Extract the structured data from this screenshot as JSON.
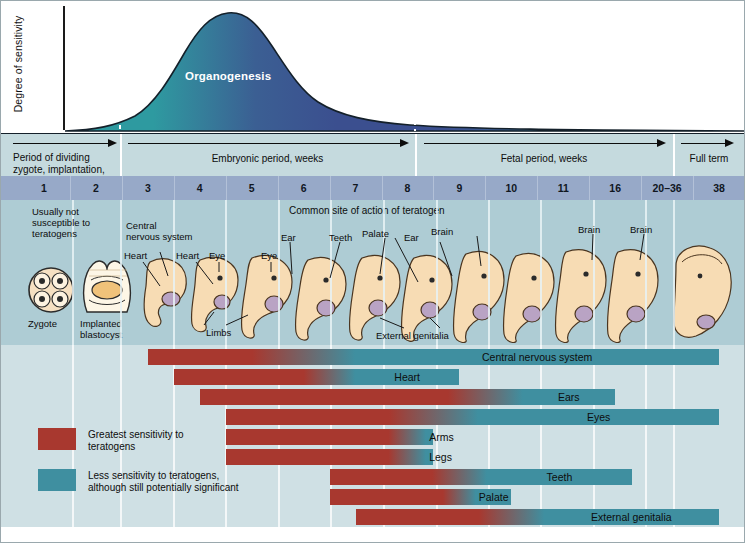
{
  "figure": {
    "y_axis_label": "Degree of sensitivity",
    "curve_label": "Organogenesis",
    "common_site_label": "Common site of action of teratogen"
  },
  "periods": [
    {
      "id": "dividing-zygote",
      "label": "Period of dividing\nzygote, implantation,\nand embryo, weeks",
      "align": "left"
    },
    {
      "id": "embryonic",
      "label": "Embryonic period, weeks",
      "align": "center"
    },
    {
      "id": "fetal",
      "label": "Fetal period, weeks",
      "align": "center"
    },
    {
      "id": "full-term",
      "label": "Full term",
      "align": "center"
    }
  ],
  "weeks": [
    "1",
    "2",
    "3",
    "4",
    "5",
    "6",
    "7",
    "8",
    "9",
    "10",
    "11",
    "16",
    "20–36",
    "38"
  ],
  "embryo_stages": [
    {
      "id": "zygote",
      "caption": "Zygote"
    },
    {
      "id": "implanted-blastocyst",
      "caption": "Implanted\nblastocyst"
    }
  ],
  "embryo_notes": [
    {
      "id": "usually-not-susceptible",
      "text": "Usually not\nsusceptible to\nteratogens"
    },
    {
      "id": "central-nervous-system",
      "text": "Central\nnervous system"
    },
    {
      "id": "heart-w3",
      "text": "Heart"
    },
    {
      "id": "heart-w4",
      "text": "Heart"
    },
    {
      "id": "eye-w4",
      "text": "Eye"
    },
    {
      "id": "eye-w5",
      "text": "Eye"
    },
    {
      "id": "limbs",
      "text": "Limbs"
    },
    {
      "id": "ear-w6",
      "text": "Ear"
    },
    {
      "id": "teeth",
      "text": "Teeth"
    },
    {
      "id": "palate",
      "text": "Palate"
    },
    {
      "id": "ear-w8",
      "text": "Ear"
    },
    {
      "id": "brain-w9",
      "text": "Brain"
    },
    {
      "id": "external-genitalia",
      "text": "External genitalia"
    },
    {
      "id": "brain-w16",
      "text": "Brain"
    },
    {
      "id": "brain-w2036",
      "text": "Brain"
    }
  ],
  "legend": {
    "greatest": "Greatest sensitivity to\nteratogens",
    "less": "Less sensitivity to teratogens,\nalthough still potentially significant",
    "greatest_color": "#a8382f",
    "less_color": "#3f8fa0"
  },
  "colors": {
    "curve_peak": "#3b4f8f",
    "curve_early": "#2e9aa0",
    "period_band": "#c5dade",
    "week_band": "#97a9c8",
    "embryo_band": "#aeccd4",
    "bars_band": "#cfe0e4"
  },
  "chart_data": {
    "type": "bar",
    "xlabel": "Weeks of gestation",
    "ylabel": "Degree of sensitivity",
    "categories": [
      "1",
      "2",
      "3",
      "4",
      "5",
      "6",
      "7",
      "8",
      "9",
      "10",
      "11",
      "16",
      "20–36",
      "38"
    ],
    "sensitivity_curve": {
      "label": "Organogenesis",
      "note": "Degree of sensitivity rises through weeks 3–5, peaks near week 4–5, then declines through the fetal period",
      "x": [
        1,
        2,
        2.5,
        3,
        4,
        5,
        6,
        7,
        8,
        9,
        10,
        11,
        16,
        20,
        38
      ],
      "y": [
        0.02,
        0.06,
        0.12,
        0.3,
        0.72,
        1.0,
        0.9,
        0.66,
        0.44,
        0.3,
        0.24,
        0.2,
        0.16,
        0.14,
        0.12
      ],
      "organogenesis_span_weeks": [
        2.5,
        8.5
      ]
    },
    "series": [
      {
        "name": "Central nervous system",
        "start_week": 3.0,
        "greatest_end_week": 6.0,
        "end_week": 38.0
      },
      {
        "name": "Heart",
        "start_week": 3.5,
        "greatest_end_week": 6.5,
        "end_week": 9.0
      },
      {
        "name": "Ears",
        "start_week": 4.0,
        "greatest_end_week": 9.5,
        "end_week": 16.0
      },
      {
        "name": "Eyes",
        "start_week": 4.5,
        "greatest_end_week": 8.5,
        "end_week": 38.0
      },
      {
        "name": "Arms",
        "start_week": 4.5,
        "greatest_end_week": 8.0,
        "end_week": 8.5
      },
      {
        "name": "Legs",
        "start_week": 4.5,
        "greatest_end_week": 8.0,
        "end_week": 8.5
      },
      {
        "name": "Teeth",
        "start_week": 6.5,
        "greatest_end_week": 9.0,
        "end_week": 20.0
      },
      {
        "name": "Palate",
        "start_week": 6.5,
        "greatest_end_week": 9.0,
        "end_week": 10.0
      },
      {
        "name": "External genitalia",
        "start_week": 7.0,
        "greatest_end_week": 10.0,
        "end_week": 38.0
      }
    ],
    "legend": [
      {
        "label": "Greatest sensitivity to teratogens",
        "color": "#a8382f"
      },
      {
        "label": "Less sensitivity to teratogens, although still potentially significant",
        "color": "#3f8fa0"
      }
    ]
  }
}
